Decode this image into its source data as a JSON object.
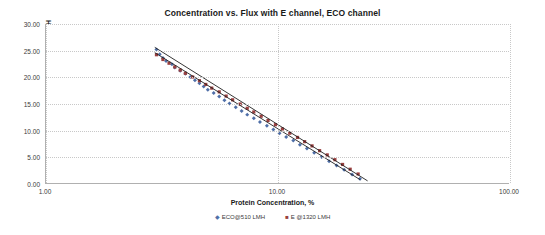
{
  "chart_data": {
    "type": "scatter",
    "title": "Concentration vs. Flux with E channel, ECO channel",
    "xlabel": "Protein Concentration, %",
    "ylabel": "Permeate Flux, LMH",
    "x_scale": "log",
    "xlim": [
      1.0,
      100.0
    ],
    "ylim": [
      0.0,
      30.0
    ],
    "grid": true,
    "legend_position": "bottom",
    "xticks": [
      "1.00",
      "10.00",
      "100.00"
    ],
    "xtick_values": [
      1,
      10,
      100
    ],
    "yticks": [
      "0.00",
      "5.00",
      "10.00",
      "15.00",
      "20.00",
      "25.00",
      "30.00"
    ],
    "ytick_values": [
      0,
      5,
      10,
      15,
      20,
      25,
      30
    ],
    "series": [
      {
        "name": "ECO@510 LMH",
        "marker": "diamond",
        "color": "#4f6fa8",
        "points": [
          [
            3.0,
            25.2
          ],
          [
            3.1,
            24.3
          ],
          [
            3.2,
            23.6
          ],
          [
            3.3,
            23.0
          ],
          [
            3.5,
            22.4
          ],
          [
            3.6,
            21.8
          ],
          [
            3.8,
            21.2
          ],
          [
            4.0,
            20.6
          ],
          [
            4.2,
            20.0
          ],
          [
            4.4,
            19.4
          ],
          [
            4.6,
            18.8
          ],
          [
            4.8,
            18.2
          ],
          [
            5.0,
            17.6
          ],
          [
            5.3,
            17.0
          ],
          [
            5.6,
            16.3
          ],
          [
            5.9,
            15.6
          ],
          [
            6.2,
            15.0
          ],
          [
            6.6,
            14.3
          ],
          [
            7.0,
            13.6
          ],
          [
            7.4,
            12.9
          ],
          [
            7.9,
            12.2
          ],
          [
            8.4,
            11.5
          ],
          [
            9.0,
            10.8
          ],
          [
            9.6,
            10.1
          ],
          [
            10.2,
            9.4
          ],
          [
            10.9,
            8.7
          ],
          [
            11.7,
            8.0
          ],
          [
            12.5,
            7.2
          ],
          [
            13.4,
            6.5
          ],
          [
            14.4,
            5.7
          ],
          [
            15.5,
            4.9
          ],
          [
            16.7,
            4.1
          ],
          [
            18.0,
            3.3
          ],
          [
            19.4,
            2.5
          ],
          [
            21.0,
            1.6
          ],
          [
            22.7,
            0.8
          ]
        ]
      },
      {
        "name": "E @1320 LMH",
        "marker": "square",
        "color": "#9a3f3f",
        "points": [
          [
            3.0,
            24.2
          ],
          [
            3.2,
            23.3
          ],
          [
            3.4,
            22.6
          ],
          [
            3.6,
            21.9
          ],
          [
            3.8,
            21.3
          ],
          [
            4.0,
            20.7
          ],
          [
            4.3,
            20.0
          ],
          [
            4.6,
            19.3
          ],
          [
            4.9,
            18.6
          ],
          [
            5.2,
            17.9
          ],
          [
            5.6,
            17.2
          ],
          [
            6.0,
            16.4
          ],
          [
            6.4,
            15.7
          ],
          [
            6.9,
            14.9
          ],
          [
            7.4,
            14.1
          ],
          [
            7.9,
            13.4
          ],
          [
            8.5,
            12.6
          ],
          [
            9.1,
            11.8
          ],
          [
            9.8,
            11.0
          ],
          [
            10.5,
            10.2
          ],
          [
            11.3,
            9.4
          ],
          [
            12.2,
            8.6
          ],
          [
            13.1,
            7.8
          ],
          [
            14.1,
            7.0
          ],
          [
            15.2,
            6.1
          ],
          [
            16.4,
            5.3
          ],
          [
            17.7,
            4.4
          ],
          [
            19.1,
            3.5
          ],
          [
            20.6,
            2.6
          ],
          [
            22.3,
            1.7
          ]
        ]
      }
    ],
    "trendlines": [
      {
        "name": "ECO@510 LMH trend",
        "color": "#1f1f1f",
        "x1": 2.95,
        "y1": 25.6,
        "x2": 24.5,
        "y2": 0.4
      },
      {
        "name": "E @1320 LMH trend",
        "color": "#1f1f1f",
        "x1": 2.95,
        "y1": 24.6,
        "x2": 22.8,
        "y2": 0.6
      }
    ],
    "legend": [
      {
        "label": "ECO@510 LMH",
        "marker": "◆",
        "color": "#4f6fa8"
      },
      {
        "label": "E @1320 LMH",
        "marker": "■",
        "color": "#9a3f3f"
      }
    ]
  }
}
